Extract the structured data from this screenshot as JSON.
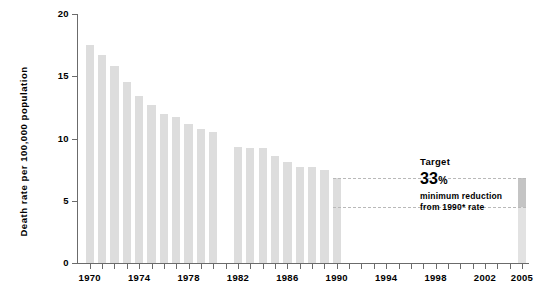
{
  "chart_data": {
    "type": "bar",
    "title": "",
    "xlabel": "",
    "ylabel": "Death rate per 100,000 population",
    "ylim": [
      0,
      20
    ],
    "yticks": [
      0,
      5,
      10,
      15,
      20
    ],
    "ytick_labels": [
      "0",
      "5",
      "10",
      "15",
      "20"
    ],
    "xlim": [
      1969.3,
      2005.9
    ],
    "xtick_years": [
      1970,
      1971,
      1972,
      1973,
      1974,
      1975,
      1976,
      1977,
      1978,
      1979,
      1980,
      1981,
      1982,
      1983,
      1984,
      1985,
      1986,
      1987,
      1988,
      1989,
      1990,
      1991,
      1992,
      1993,
      1994,
      1995,
      1996,
      1997,
      1998,
      1999,
      2000,
      2001,
      2002,
      2003,
      2004,
      2005
    ],
    "xtick_labels": [
      "1970",
      "1974",
      "1978",
      "1982",
      "1986",
      "1990",
      "1994",
      "1998",
      "2002",
      "2005"
    ],
    "xtick_label_years": [
      1970,
      1974,
      1978,
      1982,
      1986,
      1990,
      1994,
      1998,
      2002,
      2005
    ],
    "grid": false,
    "legend": false,
    "categories": [
      1970,
      1971,
      1972,
      1973,
      1974,
      1975,
      1976,
      1977,
      1978,
      1979,
      1980,
      1982,
      1983,
      1984,
      1985,
      1986,
      1987,
      1988,
      1989,
      1990
    ],
    "values": [
      17.5,
      16.7,
      15.8,
      14.5,
      13.4,
      12.7,
      12.0,
      11.7,
      11.2,
      10.8,
      10.5,
      9.3,
      9.2,
      9.2,
      8.6,
      8.1,
      7.7,
      7.7,
      7.5,
      6.8
    ],
    "target_bar": {
      "year": 2005,
      "value": 6.8,
      "segment_from": 4.5,
      "segment_to": 6.8
    },
    "reference_lines": [
      {
        "value": 6.8,
        "from_year": 1990,
        "to_year": 2005,
        "style": "dashed"
      },
      {
        "value": 4.5,
        "from_year": 1990,
        "to_year": 2005,
        "style": "dashed"
      }
    ],
    "annotations": [
      {
        "line1": "Target",
        "line2": "33",
        "line2_unit": "%",
        "line3": "minimum reduction",
        "line4": "from 1990* rate"
      }
    ],
    "colors": {
      "bar": "#dddddd",
      "target_bar": "#e2e2e2",
      "target_segment": "#c4c4c4",
      "axis": "#6b6b6b",
      "dash": "#b9b9b9",
      "text": "#000000"
    }
  }
}
